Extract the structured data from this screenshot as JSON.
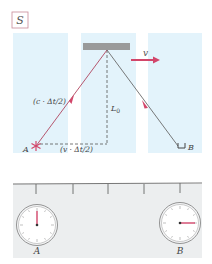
{
  "frame_label": "S",
  "velocity_label": "v",
  "hypotenuse_label": "(c · Δt/2)",
  "base_label": "(v · Δt/2)",
  "height_label": "L",
  "height_subscript": "0",
  "source_label": "A",
  "detector_label": "B",
  "clocks": [
    {
      "label": "A",
      "hand_angle_deg": 0,
      "description": "hand pointing to 12"
    },
    {
      "label": "B",
      "hand_angle_deg": 90,
      "description": "hand pointing to 3"
    }
  ],
  "ruler_ticks": 5,
  "colors": {
    "panel": "#e3f3fb",
    "mirror": "#9a9a9a",
    "ray": "#b0455f",
    "arrow": "#d2466a",
    "ruler_bg": "#eceeef",
    "frame_box": "#c98a98"
  }
}
